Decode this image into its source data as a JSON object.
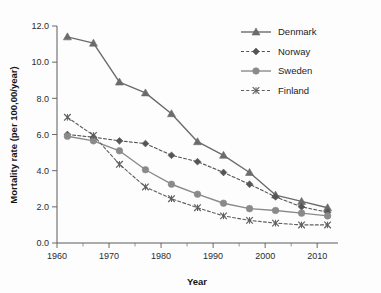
{
  "chart_data": {
    "type": "line",
    "title": "",
    "xlabel": "Year",
    "ylabel": "Mortality rate (per 100,00/year)",
    "xlim": [
      1960,
      2014
    ],
    "ylim": [
      0.0,
      12.0
    ],
    "grid": false,
    "legend_position": "top-right",
    "x": [
      1962,
      1967,
      1972,
      1977,
      1982,
      1987,
      1992,
      1997,
      2002,
      2007,
      2012
    ],
    "xticks": [
      1960,
      1970,
      1980,
      1990,
      2000,
      2010
    ],
    "xtick_labels": [
      "1960",
      "1970",
      "1980",
      "1990",
      "2000",
      "2010"
    ],
    "yticks": [
      0.0,
      2.0,
      4.0,
      6.0,
      8.0,
      10.0,
      12.0
    ],
    "ytick_labels": [
      "0.0",
      "2.0",
      "4.0",
      "6.0",
      "8.0",
      "10.0",
      "12.0"
    ],
    "series": [
      {
        "name": "Denmark",
        "marker": "triangle",
        "linestyle": "solid",
        "color": "#6b6b6b",
        "values": [
          11.4,
          11.05,
          8.9,
          8.3,
          7.15,
          5.6,
          4.85,
          3.9,
          2.65,
          2.3,
          1.95
        ]
      },
      {
        "name": "Norway",
        "marker": "diamond",
        "linestyle": "dashed",
        "color": "#555555",
        "values": [
          6.0,
          5.85,
          5.65,
          5.5,
          4.85,
          4.5,
          3.9,
          3.25,
          2.55,
          2.0,
          1.7
        ]
      },
      {
        "name": "Sweden",
        "marker": "circle",
        "linestyle": "solid",
        "color": "#8a8a8a",
        "values": [
          5.9,
          5.65,
          5.1,
          4.05,
          3.25,
          2.7,
          2.2,
          1.9,
          1.8,
          1.65,
          1.5
        ]
      },
      {
        "name": "Finland",
        "marker": "cross",
        "linestyle": "dashed",
        "color": "#5f5f5f",
        "values": [
          6.95,
          5.95,
          4.35,
          3.1,
          2.45,
          1.95,
          1.5,
          1.25,
          1.1,
          1.0,
          1.0
        ]
      }
    ]
  },
  "legend": {
    "entries": [
      {
        "label": "Denmark"
      },
      {
        "label": "Norway"
      },
      {
        "label": "Sweden"
      },
      {
        "label": "Finland"
      }
    ]
  }
}
